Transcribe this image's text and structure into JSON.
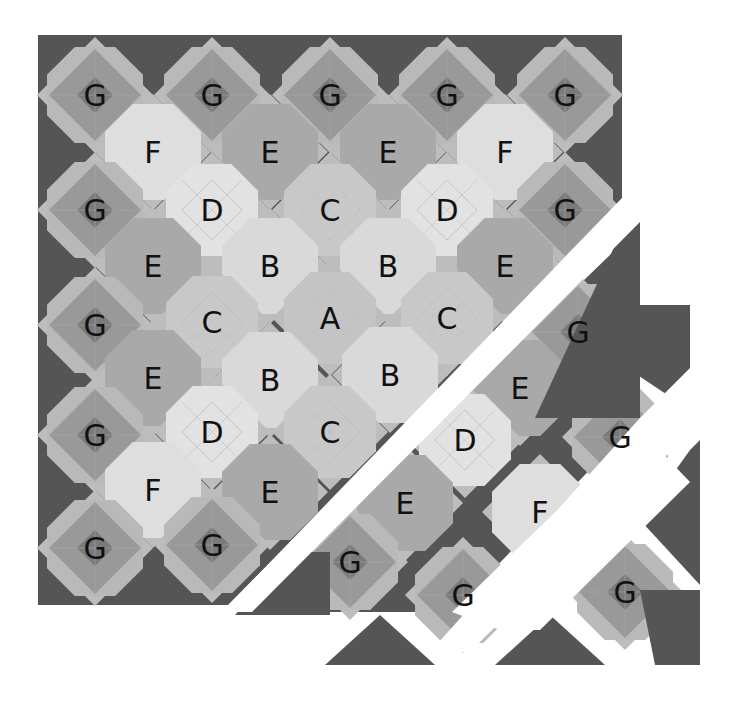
{
  "diagram": {
    "type": "quilt-layout",
    "colors": {
      "background": "#ffffff",
      "dark": "#555555",
      "hourglass_mid": "#8e8e8e",
      "G_body": "#999999",
      "G_center": "#7a7a7a",
      "G_light": "#b9b9b9",
      "A": "#c4c4c4",
      "B": "#d9d9d9",
      "C": "#c8c8c8",
      "D": "#e2e2e2",
      "E": "#a9a9a9",
      "F": "#dedede",
      "point": "#bdbdbd"
    },
    "blocks": [
      {
        "label": "G",
        "x": 95,
        "y": 95
      },
      {
        "label": "G",
        "x": 212,
        "y": 95
      },
      {
        "label": "G",
        "x": 330,
        "y": 95
      },
      {
        "label": "G",
        "x": 447,
        "y": 95
      },
      {
        "label": "G",
        "x": 565,
        "y": 95
      },
      {
        "label": "F",
        "x": 153,
        "y": 152
      },
      {
        "label": "E",
        "x": 270,
        "y": 152
      },
      {
        "label": "E",
        "x": 388,
        "y": 152
      },
      {
        "label": "F",
        "x": 505,
        "y": 152
      },
      {
        "label": "G",
        "x": 95,
        "y": 210
      },
      {
        "label": "D",
        "x": 212,
        "y": 210
      },
      {
        "label": "C",
        "x": 330,
        "y": 210
      },
      {
        "label": "D",
        "x": 447,
        "y": 210
      },
      {
        "label": "G",
        "x": 565,
        "y": 210
      },
      {
        "label": "E",
        "x": 153,
        "y": 266
      },
      {
        "label": "B",
        "x": 270,
        "y": 266
      },
      {
        "label": "B",
        "x": 388,
        "y": 266
      },
      {
        "label": "E",
        "x": 505,
        "y": 266
      },
      {
        "label": "G",
        "x": 95,
        "y": 325
      },
      {
        "label": "C",
        "x": 212,
        "y": 322
      },
      {
        "label": "A",
        "x": 330,
        "y": 318
      },
      {
        "label": "C",
        "x": 447,
        "y": 318
      },
      {
        "label": "G",
        "x": 578,
        "y": 332
      },
      {
        "label": "E",
        "x": 153,
        "y": 378
      },
      {
        "label": "B",
        "x": 270,
        "y": 380
      },
      {
        "label": "B",
        "x": 390,
        "y": 375
      },
      {
        "label": "E",
        "x": 520,
        "y": 388
      },
      {
        "label": "G",
        "x": 95,
        "y": 435
      },
      {
        "label": "D",
        "x": 212,
        "y": 432
      },
      {
        "label": "C",
        "x": 330,
        "y": 432
      },
      {
        "label": "D",
        "x": 465,
        "y": 440
      },
      {
        "label": "G",
        "x": 620,
        "y": 437
      },
      {
        "label": "F",
        "x": 153,
        "y": 490
      },
      {
        "label": "E",
        "x": 270,
        "y": 492
      },
      {
        "label": "E",
        "x": 405,
        "y": 503
      },
      {
        "label": "F",
        "x": 540,
        "y": 512
      },
      {
        "label": "G",
        "x": 95,
        "y": 548
      },
      {
        "label": "G",
        "x": 212,
        "y": 545
      },
      {
        "label": "G",
        "x": 350,
        "y": 562
      },
      {
        "label": "G",
        "x": 463,
        "y": 595
      },
      {
        "label": "G",
        "x": 625,
        "y": 592
      }
    ],
    "triangles": [
      {
        "points": "622,230 640,212 640,418 535,418"
      },
      {
        "points": "640,305 690,305 690,410 615,360"
      },
      {
        "points": "690,450 700,440 700,585 640,520"
      },
      {
        "points": "640,590 700,590 700,665 655,665"
      },
      {
        "points": "325,665 380,615 435,665"
      },
      {
        "points": "495,665 550,615 605,665"
      },
      {
        "points": "235,615 330,615 330,552 290,552"
      }
    ]
  }
}
